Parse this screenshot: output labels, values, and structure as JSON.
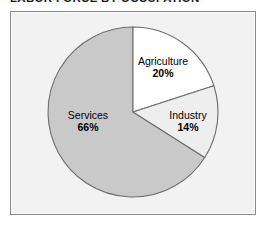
{
  "title": "LABOR FORCE BY OCCUPATION",
  "colors": {
    "frame_border": "#8a8a8a",
    "frame_background": "#f2f2f2",
    "slice_outline": "#6e6e6e",
    "agriculture_fill": "#ffffff",
    "industry_fill": "#eeeeee",
    "services_fill": "#c9c9c9",
    "label_text": "#000000",
    "title_text": "#1a1a1a"
  },
  "labels": {
    "agriculture": {
      "name": "Agriculture",
      "value": "20%"
    },
    "industry": {
      "name": "Industry",
      "value": "14%"
    },
    "services": {
      "name": "Services",
      "value": "66%"
    }
  },
  "chart_data": {
    "type": "pie",
    "title": "LABOR FORCE BY OCCUPATION",
    "subtitle": "",
    "xlabel": "",
    "ylabel": "",
    "categories": [
      "Agriculture",
      "Industry",
      "Services"
    ],
    "values": [
      20,
      14,
      66
    ],
    "value_labels": [
      "20%",
      "14%",
      "66%"
    ],
    "units": "percent",
    "total": 100,
    "start_angle_deg": 0,
    "direction": "clockwise",
    "slice_colors": [
      "#ffffff",
      "#eeeeee",
      "#c9c9c9"
    ],
    "legend": false,
    "legend_position": "none",
    "labels_inside_slices": true,
    "grid": false,
    "annotations": []
  }
}
